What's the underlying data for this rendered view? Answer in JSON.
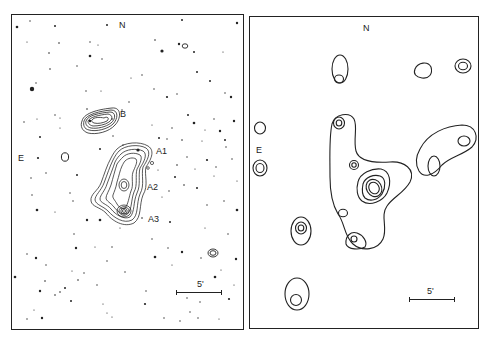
{
  "figure": {
    "left_panel": {
      "description": "Optical star field with radio contours overlaid",
      "labels": {
        "north": "N",
        "east": "E",
        "source_b": "B",
        "source_a1": "A1",
        "source_a2": "A2",
        "source_a3": "A3"
      },
      "scale_bar": {
        "label": "5'"
      }
    },
    "right_panel": {
      "description": "Contour map of sources",
      "labels": {
        "north": "N",
        "east": "E"
      },
      "scale_bar": {
        "label": "5'"
      }
    },
    "colors": {
      "ink": "#222222",
      "background": "#ffffff"
    }
  }
}
